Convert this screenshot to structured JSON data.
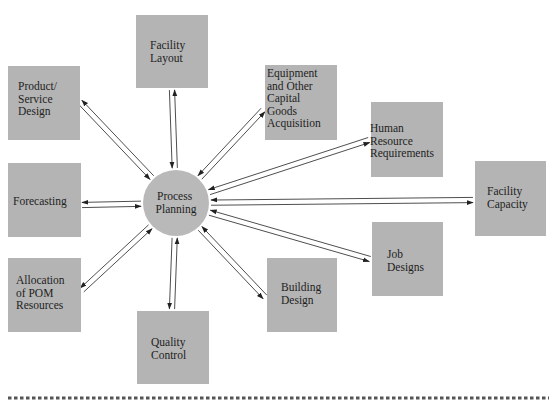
{
  "hub": {
    "lines": [
      "Process",
      "Planning"
    ]
  },
  "nodes": [
    {
      "id": "facility-layout",
      "lines": [
        "Facility",
        "Layout"
      ],
      "arrows": "both"
    },
    {
      "id": "equipment-capital-goods",
      "lines": [
        "Equipment",
        "and Other",
        "Capital",
        "Goods",
        "Acquisition"
      ],
      "arrows": "both"
    },
    {
      "id": "human-resource-requirements",
      "lines": [
        "Human",
        "Resource",
        "Requirements"
      ],
      "arrows": "both"
    },
    {
      "id": "facility-capacity",
      "lines": [
        "Facility",
        "Capacity"
      ],
      "arrows": "both"
    },
    {
      "id": "job-designs",
      "lines": [
        "Job",
        "Designs"
      ],
      "arrows": "both"
    },
    {
      "id": "building-design",
      "lines": [
        "Building",
        "Design"
      ],
      "arrows": "both"
    },
    {
      "id": "quality-control",
      "lines": [
        "Quality",
        "Control"
      ],
      "arrows": "both"
    },
    {
      "id": "allocation-pom-resources",
      "lines": [
        "Allocation",
        "of POM",
        "Resources"
      ],
      "arrows": "both"
    },
    {
      "id": "forecasting",
      "lines": [
        "Forecasting"
      ],
      "arrows": "both"
    },
    {
      "id": "product-service-design",
      "lines": [
        "Product/",
        "Service",
        "Design"
      ],
      "arrows": "both"
    }
  ]
}
